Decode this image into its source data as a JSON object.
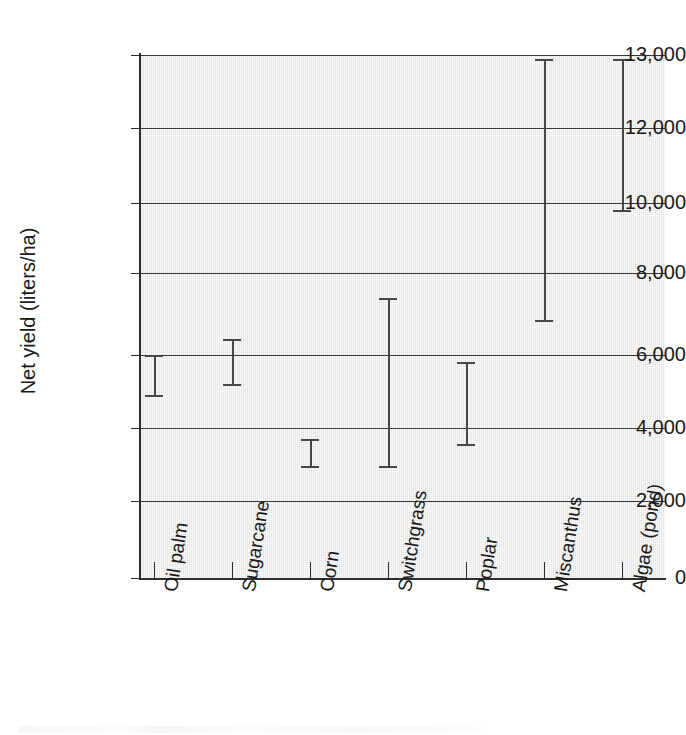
{
  "chart_data": {
    "type": "bar",
    "subtype": "error-bar-range",
    "title": "",
    "xlabel": "",
    "ylabel": "Net yield (liters/ha)",
    "categories": [
      "Oil palm",
      "Sugarcane",
      "Corn",
      "Switchgrass",
      "Poplar",
      "Miscanthus",
      "Algae (pond)"
    ],
    "ytick_labels": [
      "0",
      "2,000",
      "4,000",
      "6,000",
      "8,000",
      "10,000",
      "12,000",
      "13,000"
    ],
    "ytick_values": [
      0,
      2000,
      4000,
      6000,
      8000,
      10000,
      12000,
      13000
    ],
    "ylim": [
      0,
      13000
    ],
    "grid": true,
    "legend": false,
    "axis_note": "y-axis spacing is non-linear: the 12,000 to 13,000 interval occupies the same height as each 2,000-unit interval",
    "series": [
      {
        "name": "Net yield range",
        "low": [
          4900,
          5200,
          2950,
          2950,
          3550,
          6850,
          9800
        ],
        "high": [
          6000,
          6400,
          3700,
          7400,
          5800,
          12950,
          12950
        ]
      }
    ],
    "points": [
      {
        "category": "Oil palm",
        "low": 4900,
        "high": 6000
      },
      {
        "category": "Sugarcane",
        "low": 5200,
        "high": 6400
      },
      {
        "category": "Corn",
        "low": 2950,
        "high": 3700
      },
      {
        "category": "Switchgrass",
        "low": 2950,
        "high": 7400
      },
      {
        "category": "Poplar",
        "low": 3550,
        "high": 5800
      },
      {
        "category": "Miscanthus",
        "low": 6850,
        "high": 12950
      },
      {
        "category": "Algae (pond)",
        "low": 9800,
        "high": 12950
      }
    ],
    "colors": {
      "plot_background": "#e9e9e9",
      "gridline": "#3a3a3a",
      "axis": "#2e2e2e",
      "errorbar": "#474747",
      "text": "#1a1a1a",
      "page_background": "#ffffff"
    }
  }
}
